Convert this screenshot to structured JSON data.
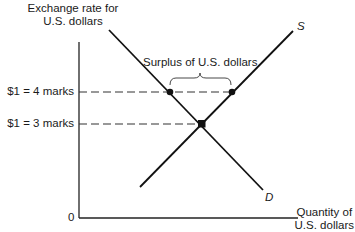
{
  "diagram": {
    "type": "supply-demand",
    "y_axis": {
      "title_line1": "Exchange rate for",
      "title_line2": "U.S. dollars"
    },
    "x_axis": {
      "title_line1": "Quantity of",
      "title_line2": "U.S. dollars"
    },
    "origin_label": "0",
    "ticks": [
      {
        "label": "$1 = 4 marks",
        "y": 92
      },
      {
        "label": "$1 = 3 marks",
        "y": 124
      }
    ],
    "curves": {
      "supply": {
        "label": "S"
      },
      "demand": {
        "label": "D"
      }
    },
    "annotation": "Surplus of U.S. dollars",
    "colors": {
      "line": "#111111",
      "dash": "#333333"
    }
  }
}
